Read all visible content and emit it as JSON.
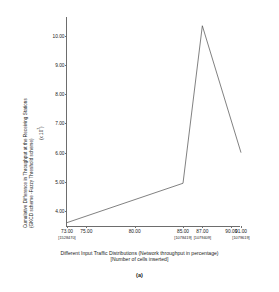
{
  "figure": {
    "caption": "(a)"
  },
  "chart_data": {
    "type": "line",
    "title": "",
    "xlabel_line1": "Different Input Traffic Distributions (Network throughput in percentage)",
    "xlabel_line2": "[Number of cells inserted]",
    "ylabel_line1": "Cumulative Difference in Throughput at the Receiving Stations",
    "ylabel_line2": "(GKCD scheme -Fuzzy Threshold scheme)",
    "y_exponent_label": "(x 10",
    "y_exponent_power": "7",
    "y_exponent_close": ")",
    "xlim": [
      73,
      91
    ],
    "ylim": [
      3.45,
      10.65
    ],
    "grid": false,
    "legend": "none",
    "xticks": [
      73,
      75,
      80,
      85,
      87,
      90,
      91
    ],
    "xtick_labels": [
      "73.00",
      "75.00",
      "80.00",
      "85.00",
      "87.00",
      "90.00",
      "91.00"
    ],
    "x_sub_annotations": [
      {
        "x": 73,
        "label": "[1528470]"
      },
      {
        "x": 85,
        "label": "[1078419]"
      },
      {
        "x": 87,
        "label": "[1079409]"
      },
      {
        "x": 91,
        "label": "[1079619]"
      }
    ],
    "yticks": [
      4,
      5,
      6,
      7,
      8,
      9,
      10
    ],
    "ytick_labels": [
      "4.00",
      "5.00",
      "6.00",
      "7.00",
      "8.00",
      "9.00",
      "10.00"
    ],
    "series": [
      {
        "name": "Cumulative difference",
        "color": "#4a4a4a",
        "x": [
          73,
          85,
          87,
          91
        ],
        "y": [
          3.6,
          4.95,
          10.35,
          6.0
        ]
      }
    ]
  }
}
